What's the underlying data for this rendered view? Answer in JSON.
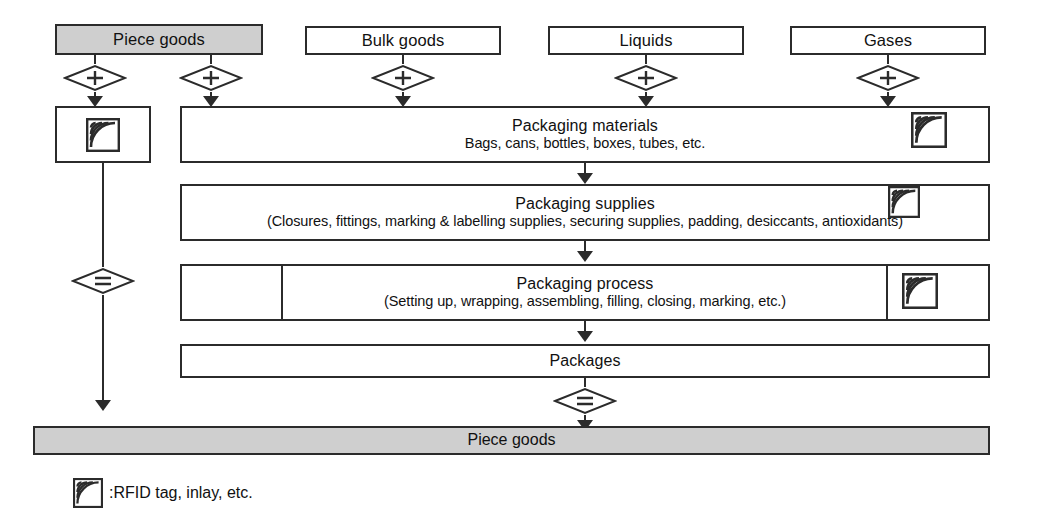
{
  "diagram": {
    "sources": [
      {
        "id": "piece-goods",
        "label": "Piece goods",
        "shaded": true
      },
      {
        "id": "bulk-goods",
        "label": "Bulk goods",
        "shaded": false
      },
      {
        "id": "liquids",
        "label": "Liquids",
        "shaded": false
      },
      {
        "id": "gases",
        "label": "Gases",
        "shaded": false
      }
    ],
    "operators": {
      "plus": "+",
      "equals": "="
    },
    "stages": [
      {
        "id": "packaging-materials",
        "title": "Packaging materials",
        "subtitle": "Bags, cans, bottles, boxes, tubes, etc.",
        "has_rfid": true
      },
      {
        "id": "packaging-supplies",
        "title": "Packaging supplies",
        "subtitle": "(Closures, fittings, marking & labelling supplies, securing supplies, padding, desiccants, antioxidants)",
        "has_rfid": true
      },
      {
        "id": "packaging-process",
        "title": "Packaging process",
        "subtitle": "(Setting up, wrapping, assembling, filling, closing, marking, etc.)",
        "has_rfid": true
      },
      {
        "id": "packages",
        "title": "Packages",
        "subtitle": "",
        "has_rfid": false
      }
    ],
    "result": {
      "id": "piece-goods-result",
      "label": "Piece goods",
      "shaded": true
    },
    "tag_box": {
      "id": "rfid-tag-box",
      "has_rfid": true
    }
  },
  "legend": {
    "icon": "rfid-tag-icon",
    "text": ":RFID tag, inlay, etc."
  },
  "colors": {
    "stroke": "#2b2b2b",
    "shaded_fill": "#cfcfcf",
    "background": "#ffffff"
  }
}
